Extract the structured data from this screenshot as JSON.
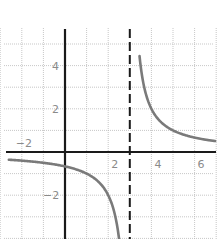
{
  "chart_data": {
    "type": "line",
    "title": "",
    "function": "f(x) = 2/(x - 3)",
    "xlabel": "",
    "ylabel": "",
    "xlim": [
      -3,
      7
    ],
    "ylim": [
      -4,
      6
    ],
    "grid": true,
    "grid_step": 1,
    "x_tick_labels": [
      {
        "value": -2,
        "label": "−2"
      },
      {
        "value": 2,
        "label": "2"
      },
      {
        "value": 4,
        "label": "4"
      },
      {
        "value": 6,
        "label": "6"
      }
    ],
    "y_tick_labels": [
      {
        "value": 4,
        "label": "4"
      },
      {
        "value": 2,
        "label": "2"
      },
      {
        "value": -2,
        "label": "−2"
      }
    ],
    "vertical_asymptote": {
      "x": 3,
      "style": "dashed"
    },
    "horizontal_asymptote": {
      "y": 0
    },
    "series": [
      {
        "name": "left branch",
        "x": [
          -2.7,
          -2,
          -1,
          0,
          1,
          2,
          2.5
        ],
        "y": [
          -0.35,
          -0.4,
          -0.5,
          -0.67,
          -1,
          -2,
          -4
        ]
      },
      {
        "name": "right branch",
        "x": [
          3.4,
          3.5,
          4,
          5,
          6,
          7
        ],
        "y": [
          5,
          4,
          2,
          1,
          0.67,
          0.5
        ]
      }
    ],
    "colors": {
      "curve": "#7a7a7a",
      "axes": "#1a1a1a",
      "grid": "#b9b9b9",
      "labels": "#8a8a8a"
    }
  }
}
